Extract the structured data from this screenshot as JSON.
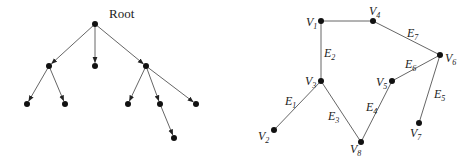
{
  "tree": {
    "root_label": "Root",
    "nodes": [
      {
        "id": "r",
        "x": 95,
        "y": 24
      },
      {
        "id": "a",
        "x": 49,
        "y": 66
      },
      {
        "id": "b",
        "x": 95,
        "y": 66
      },
      {
        "id": "c",
        "x": 146,
        "y": 66
      },
      {
        "id": "a1",
        "x": 27,
        "y": 104
      },
      {
        "id": "a2",
        "x": 65,
        "y": 104
      },
      {
        "id": "c1",
        "x": 128,
        "y": 104
      },
      {
        "id": "c2",
        "x": 160,
        "y": 104
      },
      {
        "id": "c3",
        "x": 196,
        "y": 104
      },
      {
        "id": "c21",
        "x": 174,
        "y": 138
      }
    ],
    "edges": [
      [
        "r",
        "a"
      ],
      [
        "r",
        "b"
      ],
      [
        "r",
        "c"
      ],
      [
        "a",
        "a1"
      ],
      [
        "a",
        "a2"
      ],
      [
        "c",
        "c1"
      ],
      [
        "c",
        "c2"
      ],
      [
        "c",
        "c3"
      ],
      [
        "c2",
        "c21"
      ]
    ]
  },
  "graph": {
    "vertices": [
      {
        "id": "V1",
        "base": "V",
        "sub": "1",
        "x": 321,
        "y": 21,
        "lx": 306,
        "ly": 26
      },
      {
        "id": "V2",
        "base": "V",
        "sub": "2",
        "x": 274,
        "y": 130,
        "lx": 258,
        "ly": 140
      },
      {
        "id": "V3",
        "base": "V",
        "sub": "3",
        "x": 321,
        "y": 81,
        "lx": 305,
        "ly": 85
      },
      {
        "id": "V4",
        "base": "V",
        "sub": "4",
        "x": 373,
        "y": 21,
        "lx": 369,
        "ly": 15
      },
      {
        "id": "V5",
        "base": "V",
        "sub": "5",
        "x": 392,
        "y": 81,
        "lx": 376,
        "ly": 86
      },
      {
        "id": "V6",
        "base": "V",
        "sub": "6",
        "x": 440,
        "y": 55,
        "lx": 445,
        "ly": 62
      },
      {
        "id": "V7",
        "base": "V",
        "sub": "7",
        "x": 419,
        "y": 123,
        "lx": 410,
        "ly": 137
      },
      {
        "id": "V8",
        "base": "V",
        "sub": "8",
        "x": 361,
        "y": 142,
        "lx": 350,
        "ly": 153
      }
    ],
    "edges": [
      {
        "from": "V1",
        "to": "V4",
        "label": null
      },
      {
        "from": "V1",
        "to": "V3",
        "base": "E",
        "sub": "2",
        "lx": 324,
        "ly": 57
      },
      {
        "from": "V4",
        "to": "V6",
        "base": "E",
        "sub": "7",
        "lx": 407,
        "ly": 37
      },
      {
        "from": "V3",
        "to": "V2",
        "base": "E",
        "sub": "1",
        "lx": 285,
        "ly": 105
      },
      {
        "from": "V3",
        "to": "V8",
        "base": "E",
        "sub": "3",
        "lx": 328,
        "ly": 120
      },
      {
        "from": "V8",
        "to": "V5",
        "base": "E",
        "sub": "4",
        "lx": 366,
        "ly": 111
      },
      {
        "from": "V5",
        "to": "V6",
        "base": "E",
        "sub": "6",
        "lx": 405,
        "ly": 68
      },
      {
        "from": "V6",
        "to": "V7",
        "base": "E",
        "sub": "5",
        "lx": 434,
        "ly": 98
      }
    ]
  }
}
